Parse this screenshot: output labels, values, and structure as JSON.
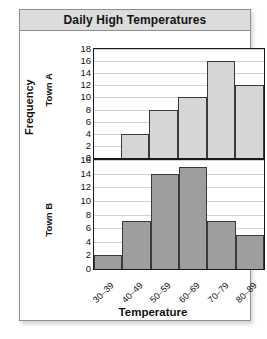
{
  "title": "Daily High Temperatures",
  "axis": {
    "y_label": "Frequency",
    "x_label": "Temperature",
    "panel_a_label": "Town A",
    "panel_b_label": "Town B"
  },
  "chart_data": {
    "type": "bar",
    "title": "Daily High Temperatures",
    "xlabel": "Temperature",
    "ylabel": "Frequency",
    "grid": true,
    "legend": "none",
    "categories": [
      "30–39",
      "40–49",
      "50–59",
      "60–69",
      "70–79",
      "80–89"
    ],
    "panels": [
      {
        "name": "Town A",
        "values": [
          0,
          4,
          8,
          10,
          16,
          12
        ],
        "ylim": [
          0,
          18
        ],
        "yticks": [
          18,
          16,
          14,
          12,
          10,
          8,
          6,
          4,
          2,
          0
        ],
        "bar_color": "#d6d6d6"
      },
      {
        "name": "Town B",
        "values": [
          2,
          7,
          14,
          15,
          7,
          5
        ],
        "ylim": [
          0,
          16
        ],
        "yticks": [
          16,
          14,
          12,
          10,
          8,
          6,
          4,
          2,
          0
        ],
        "bar_color": "#9e9e9e"
      }
    ]
  },
  "colors": {
    "title_bar": "#dcdcdc",
    "frame": "#8f8f8f",
    "gridline": "#d2d2d2",
    "axis": "#1a1a1a"
  }
}
